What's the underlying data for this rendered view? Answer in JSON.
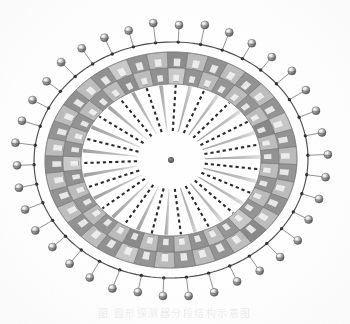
{
  "figure": {
    "kind": "scanned-technical-illustration",
    "orientation": "elliptical, viewed at a slight tilt",
    "background_color": "#fefefe",
    "center": {
      "x": 171,
      "y": 160
    },
    "center_marker": {
      "label": "center-point",
      "radius_px": 3,
      "color": "#555555"
    },
    "geometry": {
      "outer_circle_rx": 137,
      "outer_circle_ry": 118,
      "outer_band_rx": 126,
      "outer_band_ry": 108,
      "mid_band_rx": 108,
      "mid_band_ry": 92,
      "inner_band_rx": 90,
      "inner_band_ry": 76,
      "spoke_inner_rx": 34,
      "spoke_inner_ry": 29,
      "rotation_deg": -2
    },
    "segment_count": 38,
    "sphere_count": 38,
    "spoke_count": 38,
    "palette": {
      "outline": "#3a3a3a",
      "cell_light": "#b9b9b9",
      "cell_dark": "#8e8e8e",
      "cell_light_alt": "#c6c6c6",
      "cell_dark_alt": "#848484",
      "cell_tick": "#f2f2f2",
      "cell_tick_shadow": "#6a6a6a",
      "sphere_body": "#9a9a9a",
      "sphere_highlight": "#f4f4f4",
      "sphere_shadow": "#4a4a4a",
      "stalk": "#6f6f6f",
      "rim_dot": "#1f1f1f",
      "spoke_dashed": "#1a1a1a",
      "spoke_solid": "#a7a7a7",
      "paper": "#fefefe",
      "caption": "#dcdcdc"
    },
    "elements": [
      {
        "name": "outer-rim-circle",
        "description": "thin dark outline circle carrying the attachment dots"
      },
      {
        "name": "rim-attachment-dots",
        "description": "small black dots on the rim where sphere stalks attach"
      },
      {
        "name": "sphere-markers",
        "description": "small shaded 3D spheres on thin radial stalks pointing outward"
      },
      {
        "name": "outer-segment-band",
        "description": "checkerboard ring of alternating light/dark gray cells"
      },
      {
        "name": "inner-segment-band",
        "description": "second concentric checkerboard ring of cells"
      },
      {
        "name": "cell-tick-mark",
        "description": "small white rectangular tick inside each cell"
      },
      {
        "name": "radial-spokes",
        "description": "spokes from the inner band toward the centre, alternating black-dashed and tapered solid gray"
      },
      {
        "name": "center-dot",
        "description": "small dark dot marking the exact centre of the assembly"
      }
    ]
  },
  "caption": {
    "text": "图   圆形探测器分段结构示意图",
    "note_visible": "caption row is cropped and very faint at the bottom of the scan"
  }
}
